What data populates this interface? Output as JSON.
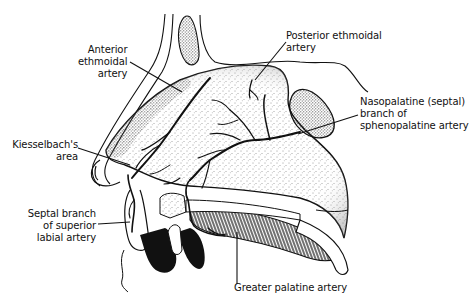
{
  "figure": {
    "colors": {
      "ink": "#111111",
      "background": "#ffffff",
      "stipple": "#333333"
    }
  },
  "labels": {
    "anterior_ethmoidal": [
      "Anterior",
      "ethmoidal",
      "artery"
    ],
    "posterior_ethmoidal": [
      "Posterior ethmoidal",
      "artery"
    ],
    "nasopalatine": [
      "Nasopalatine (septal)",
      "branch of",
      "sphenopalatine artery"
    ],
    "kiesselbach": [
      "Kiesselbach's",
      "area"
    ],
    "septal_branch": [
      "Septal branch",
      "of superior",
      "labial artery"
    ],
    "greater_palatine": [
      "Greater palatine artery"
    ]
  }
}
